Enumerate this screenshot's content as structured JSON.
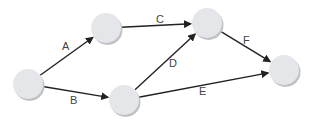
{
  "diagram": {
    "type": "directed-network",
    "node_color": "#e4e6ea",
    "edge_color": "#222222",
    "label_color": "#444444",
    "nodes": [
      {
        "id": "n1",
        "x": 28,
        "y": 84,
        "r": 15
      },
      {
        "id": "n2",
        "x": 106,
        "y": 28,
        "r": 15
      },
      {
        "id": "n3",
        "x": 124,
        "y": 100,
        "r": 15
      },
      {
        "id": "n4",
        "x": 207,
        "y": 23,
        "r": 15
      },
      {
        "id": "n5",
        "x": 284,
        "y": 70,
        "r": 15
      }
    ],
    "edges": [
      {
        "label": "A",
        "from": "n1",
        "to": "n2",
        "label_x": 62,
        "label_y": 50
      },
      {
        "label": "B",
        "from": "n1",
        "to": "n3",
        "label_x": 70,
        "label_y": 104
      },
      {
        "label": "C",
        "from": "n2",
        "to": "n4",
        "label_x": 156,
        "label_y": 23
      },
      {
        "label": "D",
        "from": "n3",
        "to": "n4",
        "label_x": 169,
        "label_y": 67
      },
      {
        "label": "E",
        "from": "n3",
        "to": "n5",
        "label_x": 199,
        "label_y": 95
      },
      {
        "label": "F",
        "from": "n4",
        "to": "n5",
        "label_x": 243,
        "label_y": 44
      }
    ]
  }
}
